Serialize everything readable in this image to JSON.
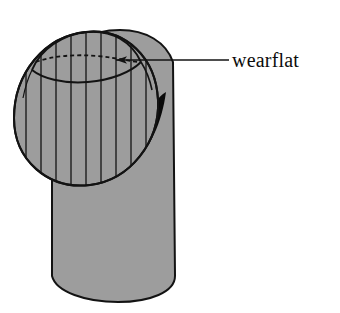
{
  "figure": {
    "name": "wearflat-on-cylindrical-tool-tip",
    "background_color": "#ffffff",
    "outline_color": "#131313",
    "fill_gray": "#9d9d9d",
    "shadow_black": "#0a0a0a",
    "annotations": [
      {
        "id": "wearflat",
        "label": "wearflat",
        "leader_line": "horizontal",
        "arrow_direction": "left",
        "arrow_tip": {
          "x": 104,
          "y": 60
        },
        "leader_start": {
          "x": 229,
          "y": 60
        },
        "text_position": {
          "x": 232,
          "y": 67
        }
      }
    ],
    "parts": [
      {
        "id": "cylinder-body",
        "name": "cylinder",
        "fill": "#9d9d9d"
      },
      {
        "id": "sphere-tip",
        "name": "spherical-tip",
        "fill": "#9d9d9d"
      },
      {
        "id": "wearflat-patch",
        "name": "wearflat-surface-patch",
        "fill": "#9d9d9d"
      },
      {
        "id": "shadow-crescent",
        "name": "shadow-crescent",
        "fill": "#0a0a0a"
      }
    ],
    "hatch": {
      "orientation": "vertical",
      "line_count": 9,
      "spacing_px": 15,
      "color": "#131313"
    },
    "hidden_edge": {
      "style": "dashed",
      "dash_pattern": "4 3",
      "description": "hidden back boundary of wearflat"
    }
  }
}
